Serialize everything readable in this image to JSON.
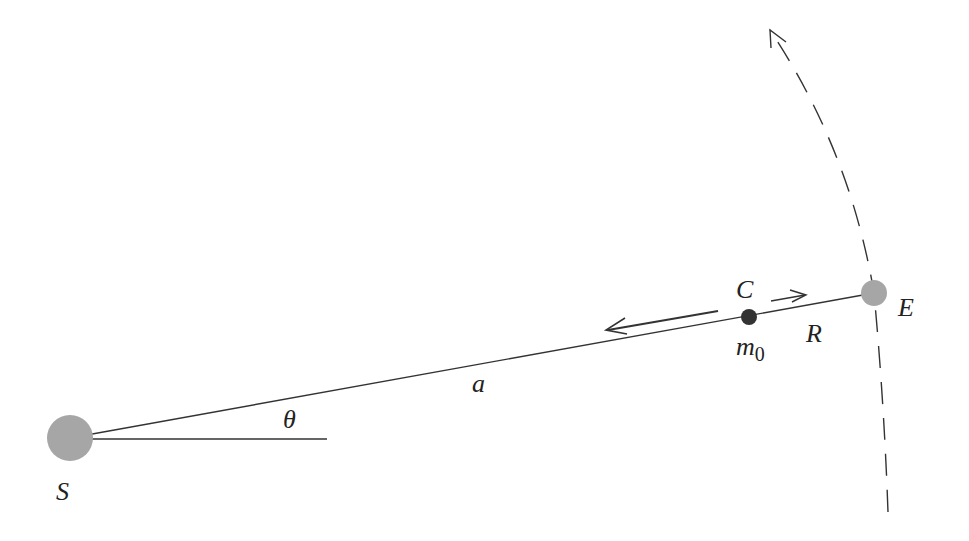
{
  "diagram": {
    "labels": {
      "sun": "S",
      "earth": "E",
      "center": "C",
      "mass": "m",
      "mass_subscript": "0",
      "distance_a": "a",
      "distance_R": "R",
      "angle": "θ"
    },
    "bodies": [
      {
        "name": "sun",
        "label": "S",
        "color": "#a6a6a6"
      },
      {
        "name": "earth",
        "label": "E",
        "color": "#a6a6a6"
      },
      {
        "name": "mass",
        "label": "m0",
        "color": "#333333"
      }
    ],
    "colors": {
      "line": "#333333",
      "body_gray": "#a6a6a6",
      "mass_dark": "#333333"
    }
  }
}
